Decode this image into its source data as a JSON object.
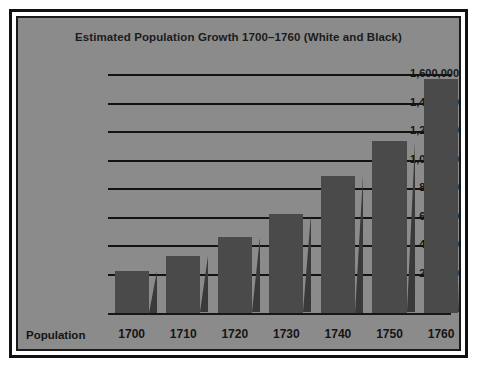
{
  "chart_data": {
    "type": "bar",
    "title": "Estimated Population Growth 1700–1760 (White and Black)",
    "xlabel": "Population",
    "ylabel": "",
    "categories": [
      "1700",
      "1710",
      "1720",
      "1730",
      "1740",
      "1750",
      "1760"
    ],
    "values": [
      230000,
      330000,
      465000,
      625000,
      895000,
      1135000,
      1570000
    ],
    "ylim": [
      0,
      1600000
    ],
    "ytick_values": [
      200000,
      400000,
      600000,
      800000,
      1000000,
      1200000,
      1400000,
      1600000
    ],
    "ytick_labels": [
      "200,000",
      "400,000",
      "600,000",
      "800,000",
      "1,000,000",
      "1,200,000",
      "1,400,000",
      "1,600,000"
    ],
    "grid": true,
    "legend": "none",
    "series": [
      {
        "name": "Estimated Population",
        "values": [
          230000,
          330000,
          465000,
          625000,
          895000,
          1135000,
          1570000
        ]
      }
    ],
    "style": {
      "panel_color": "#8b8b8b",
      "bar_color": "#4a4a4a",
      "bar_side_color": "#3a3a3a",
      "gridline_color": "#131313",
      "text_color": "#151515",
      "frame_color": "#111111",
      "page_color": "#ffffff"
    }
  }
}
